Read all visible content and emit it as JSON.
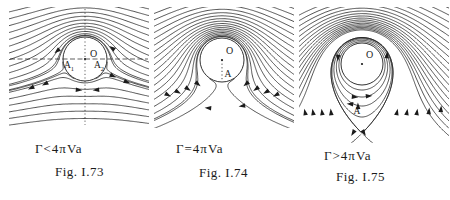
{
  "colors": {
    "ink": "#1b1b1b",
    "background": "#ffffff"
  },
  "figure": {
    "panels": [
      {
        "caption": "Γ<4πVa",
        "fig_label": "Fig. I.73",
        "labels": {
          "center": "O",
          "stagnation": [
            {
              "base": "A",
              "sub": "1"
            },
            {
              "base": "A",
              "sub": "2"
            }
          ]
        }
      },
      {
        "caption": "Γ=4πVa",
        "fig_label": "Fig. I.74",
        "labels": {
          "center": "O",
          "stagnation": [
            {
              "base": "A",
              "sub": ""
            }
          ]
        }
      },
      {
        "caption": "Γ>4πVa",
        "fig_label": "Fig. I.75",
        "labels": {
          "center": "O",
          "stagnation": [
            {
              "base": "A",
              "sub": ""
            }
          ]
        }
      }
    ]
  }
}
